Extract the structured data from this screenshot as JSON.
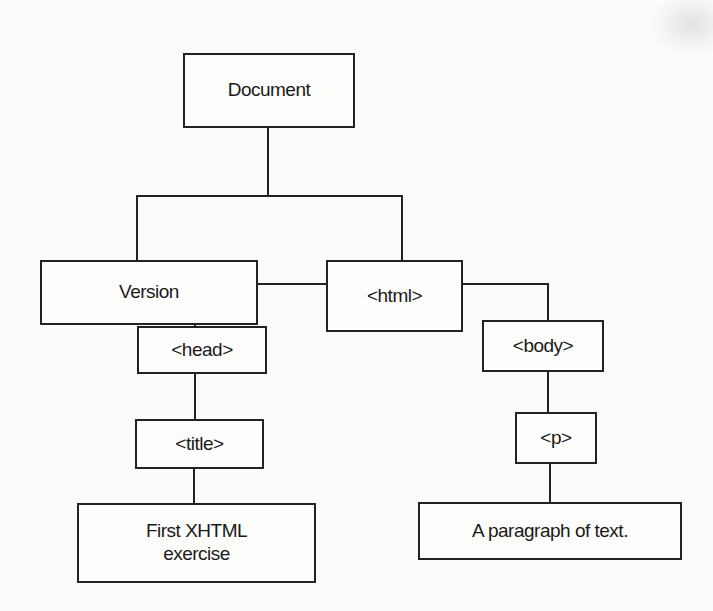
{
  "diagram": {
    "type": "tree",
    "title": "",
    "nodes": {
      "document": "Document",
      "version": "Version",
      "html": "<html>",
      "head": "<head>",
      "body": "<body>",
      "title": "<title>",
      "p": "<p>",
      "title_text_line1": "First XHTML",
      "title_text_line2": "exercise",
      "p_text": "A paragraph of text."
    },
    "edges": [
      [
        "Document",
        "Version"
      ],
      [
        "Document",
        "<html>"
      ],
      [
        "<html>",
        "<head>"
      ],
      [
        "<html>",
        "<body>"
      ],
      [
        "<head>",
        "<title>"
      ],
      [
        "<title>",
        "First XHTML exercise"
      ],
      [
        "<body>",
        "<p>"
      ],
      [
        "<p>",
        "A paragraph of text."
      ]
    ]
  }
}
